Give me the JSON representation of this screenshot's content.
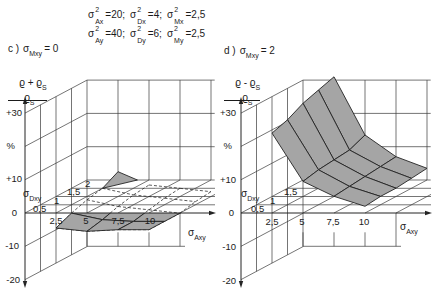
{
  "figure": {
    "header": {
      "line1": [
        {
          "sym": "σ",
          "sup": "2",
          "sub": "Ax",
          "rest": "=20;"
        },
        {
          "sym": "σ",
          "sup": "2",
          "sub": "Dx",
          "rest": "=4;"
        },
        {
          "sym": "σ",
          "sup": "2",
          "sub": "Mx",
          "rest": "=2,5"
        }
      ],
      "line2": [
        {
          "sym": "σ",
          "sup": "2",
          "sub": "Ay",
          "rest": "=40;"
        },
        {
          "sym": "σ",
          "sup": "2",
          "sub": "Dy",
          "rest": "=6;"
        },
        {
          "sym": "σ",
          "sup": "2",
          "sub": "My",
          "rest": "=2,5"
        }
      ]
    },
    "panels": [
      {
        "letter": "c )",
        "param": {
          "sym": "σ",
          "sub": "Mxy",
          "value": "= 0"
        },
        "ylabel": {
          "num": "ϱ + ϱ",
          "num_sub": "S",
          "den": "ϱ",
          "den_sub": "S"
        },
        "yticks": [
          "+30",
          "%",
          "+10",
          "0",
          "-10",
          "-20"
        ],
        "xlabel": {
          "sym": "σ",
          "sub": "Axy"
        },
        "xticks": [
          "2,5",
          "5",
          "7,5",
          "10"
        ],
        "dlabel": {
          "sym": "σ",
          "sub": "Dxy"
        },
        "dticks": [
          "0,5",
          "1",
          "1,5",
          "2"
        ]
      },
      {
        "letter": "d )",
        "param": {
          "sym": "σ",
          "sub": "Mxy",
          "value": "= 2"
        },
        "ylabel": {
          "num": "ϱ - ϱ",
          "num_sub": "S",
          "den": "ϱ",
          "den_sub": "S"
        },
        "yticks": [
          "+30",
          "%",
          "+10",
          "0",
          "-10",
          "-20"
        ],
        "xlabel": {
          "sym": "σ",
          "sub": "Axy"
        },
        "xticks": [
          "2,5",
          "5",
          "7,5",
          "10"
        ],
        "dlabel": {
          "sym": "σ",
          "sub": "Dxy"
        },
        "dticks": [
          "0,5",
          "1",
          "1,5"
        ]
      }
    ]
  },
  "chart_data": [
    {
      "type": "heatmap",
      "render": "3d-surface",
      "title": "c) σMxy = 0",
      "xlabel": "σAxy",
      "ylabel": "σDxy",
      "zlabel": "(ϱ + ϱS) / ϱS  [%]",
      "x": [
        2.5,
        5,
        7.5,
        10
      ],
      "y": [
        0,
        0.5,
        1,
        1.5,
        2
      ],
      "values": [
        [
          -4.5,
          -5.5,
          -5.0,
          -5.0
        ],
        [
          -2.5,
          -4.5,
          -5.0,
          -5.0
        ],
        [
          -1.0,
          -3.0,
          -4.0,
          -5.0
        ],
        [
          0.0,
          -2.0,
          -3.0,
          -4.0
        ],
        [
          2.5,
          -1.5,
          -2.5,
          -3.5
        ]
      ],
      "xticks": [
        2.5,
        5,
        7.5,
        10
      ],
      "yticks": [
        0.5,
        1,
        1.5,
        2
      ],
      "zticks": [
        -20,
        -10,
        0,
        10,
        20,
        30
      ],
      "zlim": [
        -20,
        30
      ],
      "grid": true,
      "legend": "none"
    },
    {
      "type": "heatmap",
      "render": "3d-surface",
      "title": "d) σMxy = 2",
      "xlabel": "σAxy",
      "ylabel": "σDxy",
      "zlabel": "(ϱ - ϱS) / ϱS  [%]",
      "x": [
        2.5,
        5,
        7.5,
        10
      ],
      "y": [
        0,
        0.5,
        1,
        1.5,
        2
      ],
      "values": [
        [
          24.0,
          9.5,
          5.0,
          2.0
        ],
        [
          25.5,
          10.5,
          5.5,
          2.5
        ],
        [
          28.0,
          11.0,
          6.0,
          2.5
        ],
        [
          29.5,
          11.5,
          6.5,
          3.0
        ],
        [
          31.0,
          13.5,
          7.0,
          3.5
        ]
      ],
      "xticks": [
        2.5,
        5,
        7.5,
        10
      ],
      "yticks": [
        0.5,
        1,
        1.5,
        2
      ],
      "zticks": [
        -20,
        -10,
        0,
        10,
        20,
        30
      ],
      "zlim": [
        -20,
        30
      ],
      "grid": true,
      "legend": "none"
    }
  ]
}
